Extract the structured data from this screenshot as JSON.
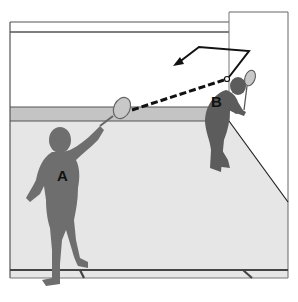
{
  "diagram": {
    "players": [
      {
        "id": "A",
        "label": "A",
        "position": "front-left, foreground, swinging racket"
      },
      {
        "id": "B",
        "label": "B",
        "position": "back-right, near front wall, bent with racket"
      }
    ],
    "ball_path": {
      "segments": [
        {
          "style": "dashed",
          "description": "from A's racket to front/side wall"
        },
        {
          "style": "solid",
          "description": "rebound off side wall and front wall"
        },
        {
          "style": "arrow",
          "description": "final direction toward left"
        }
      ]
    },
    "colors": {
      "wall": "#ffffff",
      "tin": "#c4c4c4",
      "floor": "#e6e6e6",
      "player": "#6e6e6e",
      "player_b": "#5c5c5c",
      "lines": "#555555",
      "ball_path": "#111111",
      "racket": "#c8c8c8"
    }
  }
}
